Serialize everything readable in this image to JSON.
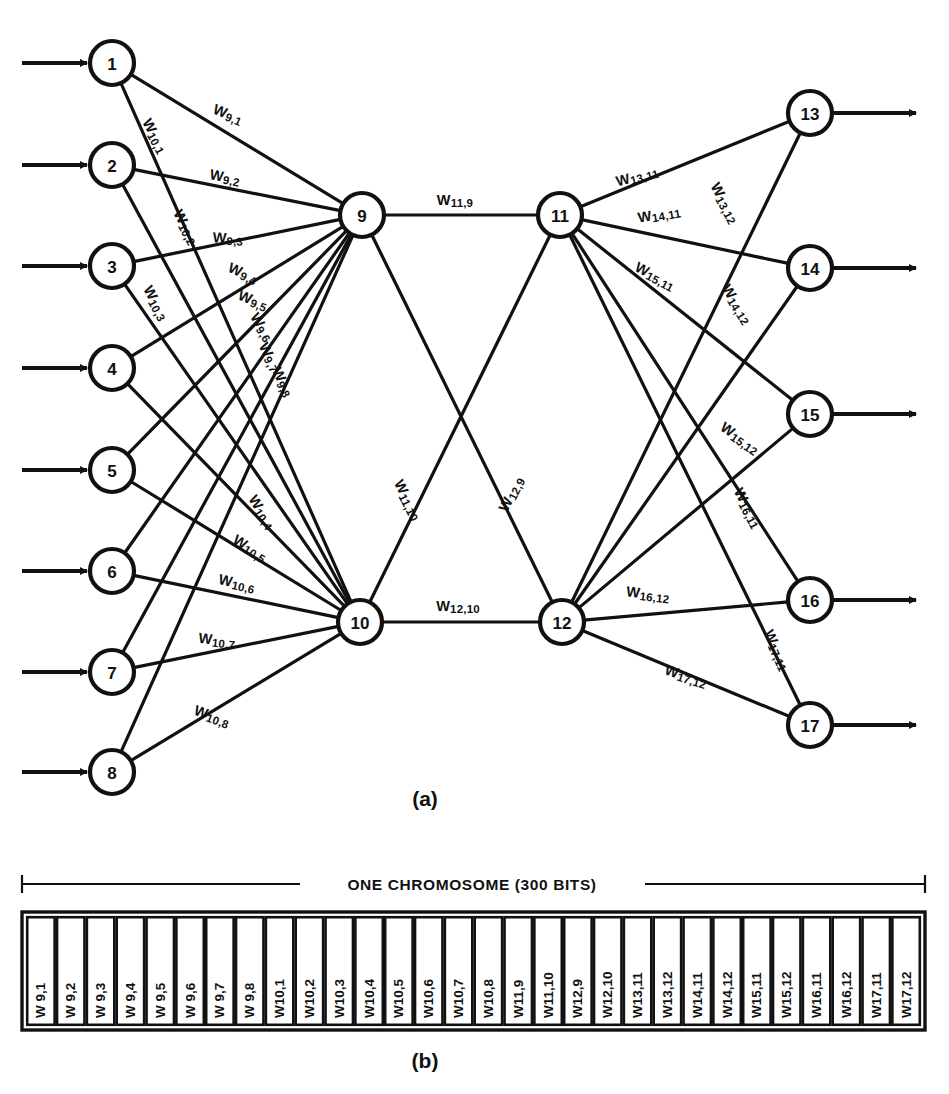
{
  "figure": {
    "panel_a_caption": "(a)",
    "panel_b_caption": "(b)",
    "chromosome_title": "ONE CHROMOSOME (300 BITS)"
  },
  "network": {
    "input_nodes": [
      {
        "id": "1",
        "x": 112,
        "y": 63
      },
      {
        "id": "2",
        "x": 112,
        "y": 165
      },
      {
        "id": "3",
        "x": 112,
        "y": 266
      },
      {
        "id": "4",
        "x": 112,
        "y": 368
      },
      {
        "id": "5",
        "x": 112,
        "y": 470
      },
      {
        "id": "6",
        "x": 112,
        "y": 571
      },
      {
        "id": "7",
        "x": 112,
        "y": 672
      },
      {
        "id": "8",
        "x": 112,
        "y": 772
      }
    ],
    "hidden_nodes_1": [
      {
        "id": "9",
        "x": 362,
        "y": 215
      },
      {
        "id": "10",
        "x": 360,
        "y": 622
      }
    ],
    "hidden_nodes_2": [
      {
        "id": "11",
        "x": 560,
        "y": 215
      },
      {
        "id": "12",
        "x": 562,
        "y": 622
      }
    ],
    "output_nodes": [
      {
        "id": "13",
        "x": 810,
        "y": 113
      },
      {
        "id": "14",
        "x": 810,
        "y": 268
      },
      {
        "id": "15",
        "x": 810,
        "y": 414
      },
      {
        "id": "16",
        "x": 810,
        "y": 600
      },
      {
        "id": "17",
        "x": 810,
        "y": 725
      }
    ],
    "edge_labels": [
      {
        "text": "W9,1",
        "x": 228,
        "y": 114,
        "rot": 22
      },
      {
        "text": "W10,1",
        "x": 155,
        "y": 136,
        "rot": 62
      },
      {
        "text": "W9,2",
        "x": 225,
        "y": 177,
        "rot": 11
      },
      {
        "text": "W10,2",
        "x": 186,
        "y": 227,
        "rot": 62
      },
      {
        "text": "W9,3",
        "x": 228,
        "y": 238,
        "rot": 3
      },
      {
        "text": "W10,3",
        "x": 156,
        "y": 303,
        "rot": 62
      },
      {
        "text": "W9,4",
        "x": 243,
        "y": 273,
        "rot": 24
      },
      {
        "text": "W9,5",
        "x": 253,
        "y": 300,
        "rot": 22
      },
      {
        "text": "W9,6",
        "x": 262,
        "y": 327,
        "rot": 58
      },
      {
        "text": "W9,7",
        "x": 270,
        "y": 357,
        "rot": 62
      },
      {
        "text": "W9,8",
        "x": 283,
        "y": 382,
        "rot": 64
      },
      {
        "text": "W10,4",
        "x": 262,
        "y": 512,
        "rot": 58
      },
      {
        "text": "W10,5",
        "x": 250,
        "y": 548,
        "rot": 32
      },
      {
        "text": "W10,6",
        "x": 237,
        "y": 583,
        "rot": 13
      },
      {
        "text": "W10,7",
        "x": 217,
        "y": 640,
        "rot": 7
      },
      {
        "text": "W10,8",
        "x": 212,
        "y": 716,
        "rot": 20
      },
      {
        "text": "W11,9",
        "x": 455,
        "y": 200,
        "rot": 0
      },
      {
        "text": "W11,10",
        "x": 408,
        "y": 500,
        "rot": 63
      },
      {
        "text": "W12,9",
        "x": 511,
        "y": 494,
        "rot": -63
      },
      {
        "text": "W12,10",
        "x": 458,
        "y": 606,
        "rot": 0
      },
      {
        "text": "W13,11",
        "x": 637,
        "y": 176,
        "rot": -15
      },
      {
        "text": "W14,11",
        "x": 659,
        "y": 214,
        "rot": -10
      },
      {
        "text": "W15,11",
        "x": 655,
        "y": 276,
        "rot": 28
      },
      {
        "text": "W13,12",
        "x": 725,
        "y": 203,
        "rot": 62
      },
      {
        "text": "W14,12",
        "x": 737,
        "y": 304,
        "rot": 58
      },
      {
        "text": "W15,12",
        "x": 740,
        "y": 438,
        "rot": 35
      },
      {
        "text": "W16,11",
        "x": 748,
        "y": 508,
        "rot": 62
      },
      {
        "text": "W16,12",
        "x": 648,
        "y": 594,
        "rot": 7
      },
      {
        "text": "W17,11",
        "x": 777,
        "y": 650,
        "rot": 66
      },
      {
        "text": "W17,12",
        "x": 686,
        "y": 676,
        "rot": 18
      }
    ]
  },
  "chromosome": {
    "cells": [
      "W 9,1",
      "W 9,2",
      "W 9,3",
      "W 9,4",
      "W 9,5",
      "W 9,6",
      "W 9,7",
      "W 9,8",
      "W10,1",
      "W10,2",
      "W10,3",
      "W10,4",
      "W10,5",
      "W10,6",
      "W10,7",
      "W10,8",
      "W11,9",
      "W11,10",
      "W12,9",
      "W12,10",
      "W13,11",
      "W13,12",
      "W14,11",
      "W14,12",
      "W15,11",
      "W15,12",
      "W16,11",
      "W16,12",
      "W17,11",
      "W17,12"
    ]
  }
}
